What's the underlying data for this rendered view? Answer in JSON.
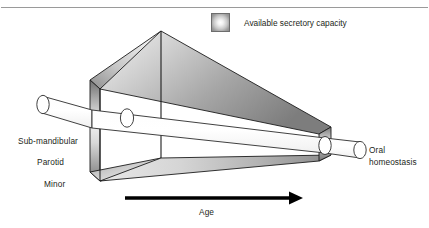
{
  "figure": {
    "background_color": "#ffffff",
    "rule_color": "#9a9a9a"
  },
  "legend": {
    "swatch_name": "gradient-square-swatch",
    "label": "Available secretory capacity"
  },
  "gland_labels": [
    {
      "name": "sub-mandibular",
      "text": "Sub-mandibular"
    },
    {
      "name": "parotid",
      "text": "Parotid"
    },
    {
      "name": "minor",
      "text": "Minor"
    }
  ],
  "outcome_label": {
    "line1": "Oral",
    "line2": "homeostasis",
    "text": "Oral homeostasis"
  },
  "axis": {
    "arrow_label": "Age",
    "arrow_direction": "right",
    "arrow_color": "#000000"
  },
  "wedge": {
    "description": "Three-dimensional tapering wedge narrowing from left to right",
    "fill_light": "#fbfbfb",
    "fill_mid": "#c4c4c4",
    "fill_dark": "#6f6f6f",
    "edge_color": "#1a1a1a"
  },
  "tube": {
    "description": "White cylindrical duct passing through the wedge from left to right",
    "fill": "#ffffff",
    "edge_color": "#2b2b2b"
  }
}
